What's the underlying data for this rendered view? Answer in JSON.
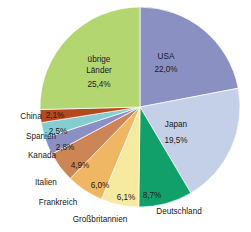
{
  "chart_data": {
    "type": "pie",
    "title": "",
    "subtitle": "",
    "xlabel": "",
    "ylabel": "",
    "legend_position": "none",
    "grid": false,
    "total": 100.0,
    "unit": "%",
    "decimal_separator": ",",
    "categories": [
      "USA",
      "Japan",
      "Deutschland",
      "Großbritannien",
      "Frankreich",
      "Italien",
      "Kanada",
      "Spanien",
      "China",
      "übrige Länder"
    ],
    "values": [
      22.0,
      19.5,
      8.7,
      6.1,
      6.0,
      4.9,
      2.8,
      2.5,
      2.1,
      25.4
    ],
    "value_labels": [
      "22,0%",
      "19,5%",
      "8,7%",
      "6,1%",
      "6,0%",
      "4,9%",
      "2,8%",
      "2,5%",
      "2,1%",
      "25,4%"
    ],
    "colors": [
      "#8b90c2",
      "#c3d0e8",
      "#12a06a",
      "#f6e9a0",
      "#efb763",
      "#cd8555",
      "#8b8fc4",
      "#86cdd2",
      "#b5481f",
      "#b4d671"
    ],
    "slices": [
      {
        "name": "USA",
        "value": 22.0,
        "value_label": "22,0%",
        "color": "#8b90c2",
        "label_placement": "inside",
        "name_x": 166,
        "name_y": 59,
        "value_x": 166,
        "value_y": 72
      },
      {
        "name": "Japan",
        "value": 19.5,
        "value_label": "19,5%",
        "color": "#c3d0e8",
        "label_placement": "inside",
        "name_x": 176,
        "name_y": 127,
        "value_x": 176,
        "value_y": 143
      },
      {
        "name": "Deutschland",
        "value": 8.7,
        "value_label": "8,7%",
        "color": "#12a06a",
        "label_placement": "outside",
        "name_x": 179,
        "name_y": 214,
        "value_x": 152,
        "value_y": 198
      },
      {
        "name": "Großbritannien",
        "value": 6.1,
        "value_label": "6,1%",
        "color": "#f6e9a0",
        "label_placement": "outside",
        "name_x": 100,
        "name_y": 222,
        "value_x": 126,
        "value_y": 200
      },
      {
        "name": "Frankreich",
        "value": 6.0,
        "value_label": "6,0%",
        "color": "#efb763",
        "label_placement": "outside",
        "name_x": 58,
        "name_y": 205,
        "value_x": 100,
        "value_y": 188
      },
      {
        "name": "Italien",
        "value": 4.9,
        "value_label": "4,9%",
        "color": "#cd8555",
        "label_placement": "outside",
        "name_x": 46,
        "name_y": 185,
        "value_x": 80,
        "value_y": 168
      },
      {
        "name": "Kanada",
        "value": 2.8,
        "value_label": "2,8%",
        "color": "#8b8fc4",
        "label_placement": "outside",
        "name_x": 42,
        "name_y": 158,
        "value_x": 65,
        "value_y": 150
      },
      {
        "name": "Spanien",
        "value": 2.5,
        "value_label": "2,5%",
        "color": "#86cdd2",
        "label_placement": "outside",
        "name_x": 41,
        "name_y": 139,
        "value_x": 58,
        "value_y": 134
      },
      {
        "name": "China",
        "value": 2.1,
        "value_label": "2,1%",
        "color": "#b5481f",
        "label_placement": "outside",
        "name_x": 31,
        "name_y": 119,
        "value_x": 55,
        "value_y": 118
      },
      {
        "name": "übrige Länder",
        "value": 25.4,
        "value_label": "25,4%",
        "color": "#b4d671",
        "label_placement": "inside",
        "name_x": 99,
        "name_y": 62,
        "value_x": 99,
        "value_y": 87
      }
    ],
    "geometry": {
      "center_x": 140,
      "center_y": 107,
      "radius": 100,
      "start_angle_deg": -90,
      "direction": "clockwise"
    }
  }
}
